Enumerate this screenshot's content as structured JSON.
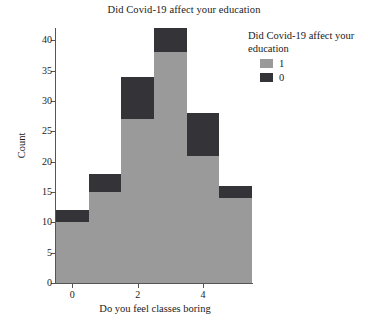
{
  "chart_data": {
    "type": "bar",
    "title": "Did Covid-19 affect your education",
    "xlabel": "Do you feel classes boring",
    "ylabel": "Count",
    "categories": [
      "0",
      "1",
      "2",
      "3",
      "4",
      "5"
    ],
    "x": [
      0,
      1,
      2,
      3,
      4,
      5
    ],
    "xlim": [
      -0.5,
      5.5
    ],
    "ylim": [
      0,
      42
    ],
    "xticks": [
      0,
      2,
      4
    ],
    "xtick_labels": [
      "0",
      "2",
      "4"
    ],
    "yticks": [
      0,
      5,
      10,
      15,
      20,
      25,
      30,
      35,
      40
    ],
    "ytick_labels": [
      "0",
      "5",
      "10",
      "15",
      "20",
      "25",
      "30",
      "35",
      "40"
    ],
    "grid": false,
    "stacked": true,
    "legend": {
      "title": "Did Covid-19 affect your education",
      "position": "right-top",
      "entries": [
        {
          "label": "1",
          "color": "#9a9a9a"
        },
        {
          "label": "0",
          "color": "#333338"
        }
      ]
    },
    "series": [
      {
        "name": "1",
        "color": "#9a9a9a",
        "values": [
          10,
          15,
          27,
          38,
          21,
          14
        ]
      },
      {
        "name": "0",
        "color": "#333338",
        "values": [
          2,
          3,
          7,
          4,
          7,
          2
        ]
      }
    ],
    "totals": [
      12,
      18,
      34,
      42,
      28,
      16
    ]
  },
  "axes": {
    "ylabel": "Count",
    "xlabel": "Do you feel classes boring"
  },
  "title": "Did Covid-19 affect your education"
}
